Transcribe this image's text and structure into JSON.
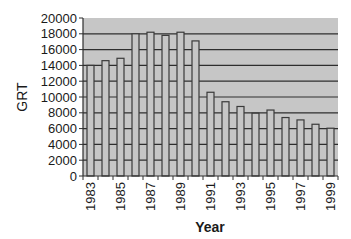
{
  "chart_data": {
    "type": "bar",
    "title": "",
    "xlabel": "Year",
    "ylabel": "GRT",
    "ylim": [
      0,
      20000
    ],
    "yticks": [
      0,
      2000,
      4000,
      6000,
      8000,
      10000,
      12000,
      14000,
      16000,
      18000,
      20000
    ],
    "xtick_labels": [
      "1983",
      "1985",
      "1987",
      "1989",
      "1991",
      "1993",
      "1995",
      "1997",
      "1999"
    ],
    "grid": true,
    "legend": null,
    "categories": [
      "1983",
      "1984",
      "1985",
      "1986",
      "1987",
      "1988",
      "1989",
      "1990",
      "1991",
      "1992",
      "1993",
      "1994",
      "1995",
      "1996",
      "1997",
      "1998",
      "1999"
    ],
    "values": [
      14000,
      14600,
      14900,
      18000,
      18200,
      17800,
      18200,
      17100,
      10600,
      9400,
      8800,
      7950,
      8350,
      7400,
      7100,
      6550,
      6050
    ]
  },
  "colors": {
    "plot_background": "#c6c6c6",
    "bar_fill": "#c6c6c6",
    "bar_edge": "#3a3a3a",
    "gridline": "#2e2e2e",
    "axis": "#2e2e2e"
  }
}
